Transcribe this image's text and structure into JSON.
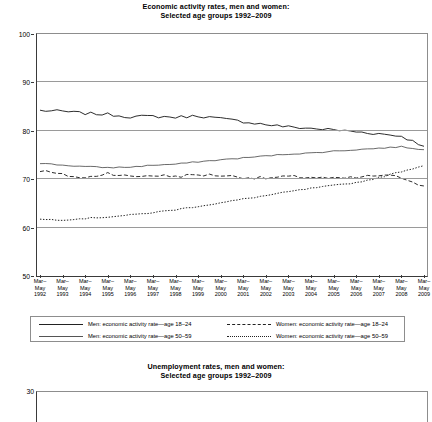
{
  "charts": [
    {
      "title_line1": "Economic activity rates, men and women:",
      "title_line2": "Selected age groups 1992–2009",
      "ylabel": "As % of age group"
    },
    {
      "title_line1": "Unemployment rates, men and women:",
      "title_line2": "Selected age groups 1992–2009",
      "ylabel": ""
    }
  ],
  "legend": {
    "items": [
      {
        "label": "Men: economic activity rate—age 18–24",
        "style": "solid"
      },
      {
        "label": "Women: economic activity rate—age 18–24",
        "style": "dash"
      },
      {
        "label": "Men: economic activity rate—age 50–59",
        "style": "thin"
      },
      {
        "label": "Women: economic activity rate—age 50–59",
        "style": "dot"
      }
    ]
  },
  "chart_data": [
    {
      "type": "line",
      "title": "Economic activity rates, men and women: Selected age groups 1992–2009",
      "xlabel": "",
      "ylabel": "As % of age group",
      "ylim": [
        50,
        100
      ],
      "yticks": [
        50,
        60,
        70,
        80,
        90,
        100
      ],
      "grid": true,
      "legend_position": "below",
      "x_period_label": "Mar–May",
      "categories": [
        "Mar–May 1992",
        "Mar–May 1993",
        "Mar–May 1994",
        "Mar–May 1995",
        "Mar–May 1996",
        "Mar–May 1997",
        "Mar–May 1998",
        "Mar–May 1999",
        "Mar–May 2000",
        "Mar–May 2001",
        "Mar–May 2002",
        "Mar–May 2003",
        "Mar–May 2004",
        "Mar–May 2005",
        "Mar–May 2006",
        "Mar–May 2007",
        "Mar–May 2008",
        "Mar–May 2009"
      ],
      "x_years": [
        1992,
        1993,
        1994,
        1995,
        1996,
        1997,
        1998,
        1999,
        2000,
        2001,
        2002,
        2003,
        2004,
        2005,
        2006,
        2007,
        2008,
        2009
      ],
      "series": [
        {
          "name": "Men: economic activity rate—age 18–24",
          "style": "solid",
          "values": [
            84.2,
            84.0,
            83.6,
            83.4,
            82.9,
            83.0,
            82.8,
            83.1,
            82.5,
            81.9,
            81.3,
            80.8,
            80.5,
            80.2,
            79.8,
            79.4,
            78.9,
            76.8
          ]
        },
        {
          "name": "Women: economic activity rate—age 18–24",
          "style": "dash",
          "values": [
            71.8,
            70.9,
            70.2,
            71.3,
            70.5,
            70.8,
            70.6,
            70.9,
            70.8,
            70.4,
            70.2,
            70.5,
            70.4,
            70.1,
            70.3,
            70.8,
            70.4,
            68.6
          ]
        },
        {
          "name": "Men: economic activity rate—age 50–59",
          "style": "thin",
          "values": [
            73.3,
            72.9,
            72.6,
            72.4,
            72.5,
            72.9,
            73.1,
            73.6,
            74.0,
            74.4,
            74.8,
            75.2,
            75.4,
            75.8,
            76.1,
            76.4,
            76.7,
            76.1
          ]
        },
        {
          "name": "Women: economic activity rate—age 50–59",
          "style": "dot",
          "values": [
            61.7,
            61.6,
            61.9,
            62.2,
            62.6,
            63.1,
            63.7,
            64.4,
            65.1,
            65.9,
            66.6,
            67.4,
            68.1,
            68.7,
            69.3,
            70.3,
            71.6,
            72.8
          ]
        }
      ]
    },
    {
      "type": "line",
      "title": "Unemployment rates, men and women: Selected age groups 1992–2009",
      "xlabel": "",
      "ylabel": "",
      "ylim": [
        0,
        30
      ],
      "yticks": [
        30
      ],
      "grid": true,
      "series": []
    }
  ]
}
